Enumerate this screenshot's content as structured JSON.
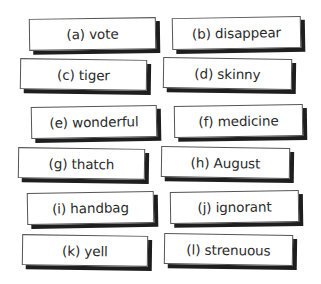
{
  "cards": [
    {
      "id": "a",
      "label": "(a) vote"
    },
    {
      "id": "b",
      "label": "(b) disappear"
    },
    {
      "id": "c",
      "label": "(c) tiger"
    },
    {
      "id": "d",
      "label": "(d) skinny"
    },
    {
      "id": "e",
      "label": "(e) wonderful"
    },
    {
      "id": "f",
      "label": "(f) medicine"
    },
    {
      "id": "g",
      "label": "(g) thatch"
    },
    {
      "id": "h",
      "label": "(h) August"
    },
    {
      "id": "i",
      "label": "(i) handbag"
    },
    {
      "id": "j",
      "label": "(j) ignorant"
    },
    {
      "id": "k",
      "label": "(k) yell"
    },
    {
      "id": "l",
      "label": "(l) strenuous"
    }
  ]
}
